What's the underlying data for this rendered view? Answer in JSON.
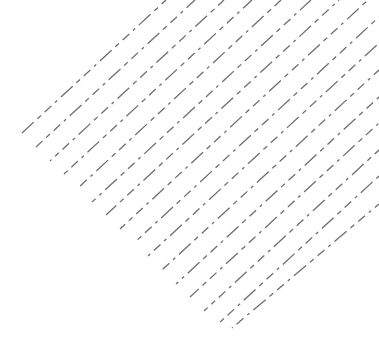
{
  "pattern": {
    "type": "diagonal-dashed-lines",
    "background": "#ffffff",
    "stroke_color": "#6e6e6e",
    "stroke_width": 1.3,
    "dasharray": "16 5 5 5 9 5 3 5",
    "lines": [
      {
        "x1": 22,
        "y1": 133,
        "x2": 166,
        "y2": 0
      },
      {
        "x1": 36,
        "y1": 147,
        "x2": 195,
        "y2": 0
      },
      {
        "x1": 50,
        "y1": 161,
        "x2": 224,
        "y2": 0
      },
      {
        "x1": 64,
        "y1": 174,
        "x2": 252,
        "y2": 0
      },
      {
        "x1": 78,
        "y1": 188,
        "x2": 281,
        "y2": 0
      },
      {
        "x1": 92,
        "y1": 202,
        "x2": 311,
        "y2": 0
      },
      {
        "x1": 106,
        "y1": 215,
        "x2": 339,
        "y2": 0
      },
      {
        "x1": 120,
        "y1": 229,
        "x2": 368,
        "y2": 0
      },
      {
        "x1": 134,
        "y1": 243,
        "x2": 379,
        "y2": 17
      },
      {
        "x1": 148,
        "y1": 256,
        "x2": 379,
        "y2": 43
      },
      {
        "x1": 162,
        "y1": 270,
        "x2": 379,
        "y2": 70
      },
      {
        "x1": 176,
        "y1": 284,
        "x2": 379,
        "y2": 97
      },
      {
        "x1": 190,
        "y1": 297,
        "x2": 379,
        "y2": 123
      },
      {
        "x1": 204,
        "y1": 311,
        "x2": 379,
        "y2": 150
      },
      {
        "x1": 218,
        "y1": 324,
        "x2": 379,
        "y2": 176
      },
      {
        "x1": 232,
        "y1": 328,
        "x2": 379,
        "y2": 204
      }
    ]
  }
}
